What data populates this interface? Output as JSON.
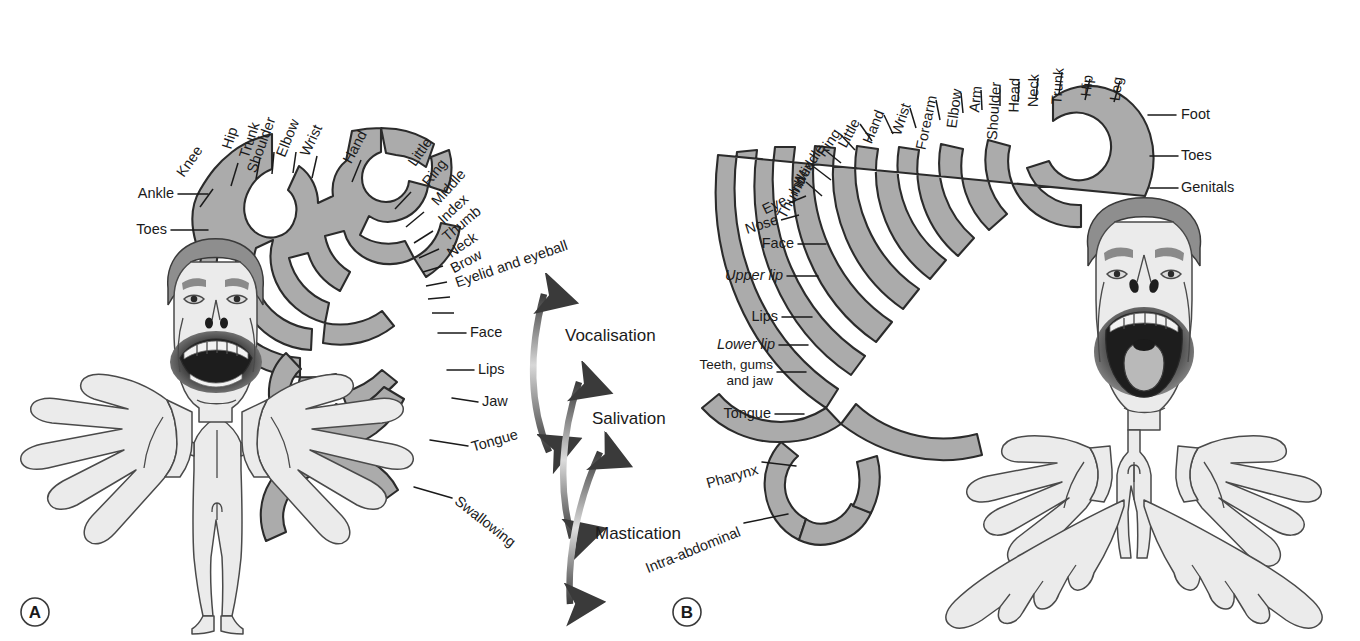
{
  "figure": {
    "background_color": "#ffffff",
    "cortex_color": "#ababab",
    "cortex_outline_color": "#2b2b2b",
    "skin_color": "#ebebeb",
    "hair_color": "#8e8e8e"
  },
  "panels": [
    {
      "id": "A",
      "letter": "A",
      "name": "motor-homunculus",
      "figure_description": "Motor homunculus: enlarged face, lips, tongue and hands; small trunk and legs",
      "labels_top": [
        "Knee",
        "Hip",
        "Trunk",
        "Shoulder",
        "Elbow",
        "Wrist",
        "Hand",
        "Little",
        "Ring",
        "Middle",
        "Index",
        "Thumb",
        "Neck",
        "Brow"
      ],
      "labels_left": [
        "Ankle",
        "Toes"
      ],
      "labels_right": [
        "Eyelid and eyeball",
        "Face",
        "Lips",
        "Jaw",
        "Tongue",
        "Swallowing"
      ],
      "function_arrows": [
        "Vocalisation",
        "Salivation",
        "Mastication"
      ]
    },
    {
      "id": "B",
      "letter": "B",
      "name": "sensory-homunculus",
      "figure_description": "Somatosensory homunculus: enlarged lips, tongue, hands and feet",
      "labels_top": [
        "Thumb",
        "Index",
        "Middle",
        "Ring",
        "Little",
        "Hand",
        "Wrist",
        "Forearm",
        "Elbow",
        "Arm",
        "Shoulder",
        "Head",
        "Neck",
        "Trunk",
        "Hip",
        "Leg"
      ],
      "labels_left": [
        "Eye",
        "Nose",
        "Face",
        "Upper lip",
        "Lips",
        "Lower lip",
        "Teeth, gums and jaw",
        "Tongue",
        "Pharynx",
        "Intra-abdominal"
      ],
      "labels_right": [
        "Foot",
        "Toes",
        "Genitals"
      ]
    }
  ]
}
